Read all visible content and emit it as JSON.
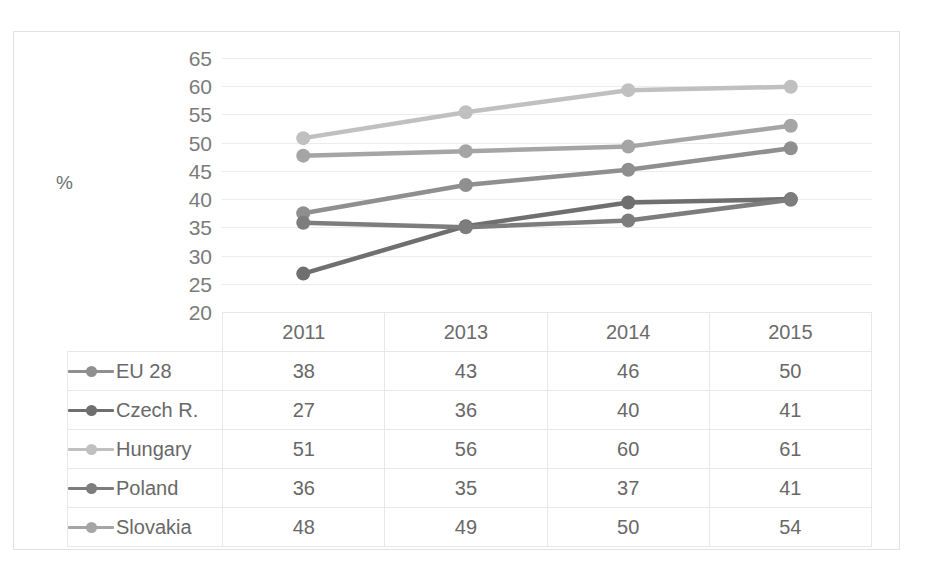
{
  "chart_data": {
    "type": "line",
    "title": "",
    "xlabel": "",
    "ylabel": "%",
    "ylim": [
      20,
      65
    ],
    "ytick_step": 5,
    "yticks": [
      65,
      60,
      55,
      50,
      45,
      40,
      35,
      30,
      25,
      20
    ],
    "grid": true,
    "legend_position": "table-left-column",
    "categories": [
      "2011",
      "2013",
      "2014",
      "2015"
    ],
    "series": [
      {
        "name": "EU 28",
        "values": [
          38,
          43,
          46,
          50
        ],
        "plotted": [
          37.5,
          42.5,
          45.2,
          49.0
        ],
        "color": "#8f8f8f"
      },
      {
        "name": "Czech R.",
        "values": [
          27,
          36,
          40,
          41
        ],
        "plotted": [
          26.8,
          35.2,
          39.4,
          40.0
        ],
        "color": "#6f6f6f"
      },
      {
        "name": "Hungary",
        "values": [
          51,
          56,
          60,
          61
        ],
        "plotted": [
          50.8,
          55.4,
          59.3,
          59.9
        ],
        "color": "#c0c0c0"
      },
      {
        "name": "Poland",
        "values": [
          36,
          35,
          37,
          41
        ],
        "plotted": [
          35.8,
          35.0,
          36.2,
          39.9
        ],
        "color": "#7d7d7d"
      },
      {
        "name": "Slovakia",
        "values": [
          48,
          49,
          50,
          54
        ],
        "plotted": [
          47.7,
          48.5,
          49.3,
          53.0
        ],
        "color": "#a5a5a5"
      }
    ]
  },
  "table": {
    "header": [
      "",
      "2011",
      "2013",
      "2014",
      "2015"
    ],
    "rows": [
      {
        "label": "EU 28",
        "cells": [
          "38",
          "43",
          "46",
          "50"
        ]
      },
      {
        "label": "Czech R.",
        "cells": [
          "27",
          "36",
          "40",
          "41"
        ]
      },
      {
        "label": "Hungary",
        "cells": [
          "51",
          "56",
          "60",
          "61"
        ]
      },
      {
        "label": "Poland",
        "cells": [
          "36",
          "35",
          "37",
          "41"
        ]
      },
      {
        "label": "Slovakia",
        "cells": [
          "48",
          "49",
          "50",
          "54"
        ]
      }
    ]
  },
  "colors": {
    "gridline": "#edeced",
    "frame": "#e2e2e2",
    "text": "#686868",
    "background": "#ffffff"
  }
}
